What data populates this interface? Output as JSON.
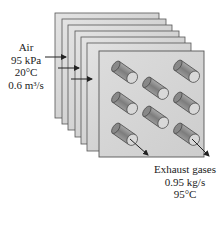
{
  "diagram": {
    "plate_count": 7,
    "tube_count": 8,
    "colors": {
      "plate_fill": "#cfcfcf",
      "plate_edge": "#555555",
      "front_plate_fill": "#d9d9d9",
      "tube": "#888888",
      "arrow": "#222222"
    }
  },
  "air_label": {
    "lines": [
      "Air",
      "95 kPa",
      "20°C",
      "0.6 m³/s"
    ]
  },
  "exhaust_label": {
    "lines": [
      "Exhaust gases",
      "0.95 kg/s",
      "95°C"
    ]
  }
}
